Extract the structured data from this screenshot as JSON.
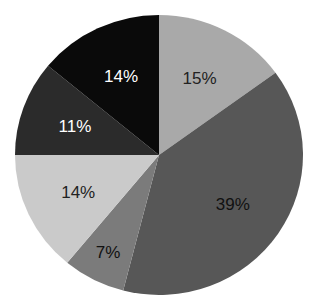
{
  "chart_data": {
    "type": "pie",
    "title": "",
    "start_angle": "12 o'clock",
    "direction": "clockwise",
    "slices": [
      {
        "label": "15%",
        "value": 15,
        "color": "#a9a9a9",
        "text_color": "#222222"
      },
      {
        "label": "39%",
        "value": 39,
        "color": "#575757",
        "text_color": "#111111"
      },
      {
        "label": "7%",
        "value": 7,
        "color": "#7b7b7b",
        "text_color": "#111111"
      },
      {
        "label": "14%",
        "value": 14,
        "color": "#cacaca",
        "text_color": "#222222"
      },
      {
        "label": "11%",
        "value": 11,
        "color": "#2b2b2b",
        "text_color": "#ffffff"
      },
      {
        "label": "14%",
        "value": 14,
        "color": "#0a0a0a",
        "text_color": "#ffffff"
      }
    ],
    "legend": null
  }
}
